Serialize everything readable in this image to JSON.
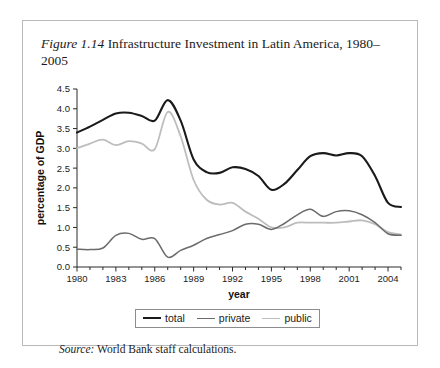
{
  "figure": {
    "label": "Figure 1.14",
    "caption": "Infrastructure Investment in Latin America, 1980–2005"
  },
  "source": {
    "label": "Source:",
    "text": "World Bank staff calculations."
  },
  "legend": {
    "position": "bottom-center",
    "items": [
      {
        "name": "total",
        "color": "#1a1a1a",
        "width": 2.1
      },
      {
        "name": "private",
        "color": "#6b6b6b",
        "width": 1.5
      },
      {
        "name": "public",
        "color": "#bdbdbd",
        "width": 1.8
      }
    ]
  },
  "chart_data": {
    "type": "line",
    "title": "Infrastructure Investment in Latin America, 1980–2005",
    "xlabel": "year",
    "ylabel": "percentage of GDP",
    "xlim": [
      1980,
      2005
    ],
    "ylim": [
      0.0,
      4.5
    ],
    "grid": false,
    "xticks": [
      1980,
      1983,
      1986,
      1989,
      1992,
      1995,
      1998,
      2001,
      2004
    ],
    "xtick_minor_step": 1,
    "yticks": [
      0.0,
      0.5,
      1.0,
      1.5,
      2.0,
      2.5,
      3.0,
      3.5,
      4.0,
      4.5
    ],
    "ytick_labels": [
      "0.0",
      "0.5",
      "1.0",
      "1.5",
      "2.0",
      "2.5",
      "3.0",
      "3.5",
      "4.0",
      "4.5"
    ],
    "x": [
      1980,
      1981,
      1982,
      1983,
      1984,
      1985,
      1986,
      1987,
      1988,
      1989,
      1990,
      1991,
      1992,
      1993,
      1994,
      1995,
      1996,
      1997,
      1998,
      1999,
      2000,
      2001,
      2002,
      2003,
      2004,
      2005
    ],
    "series": [
      {
        "name": "total",
        "color": "#1a1a1a",
        "width": 2.1,
        "values": [
          3.4,
          3.55,
          3.72,
          3.88,
          3.9,
          3.82,
          3.7,
          4.22,
          3.7,
          2.72,
          2.4,
          2.38,
          2.52,
          2.48,
          2.3,
          1.95,
          2.1,
          2.45,
          2.8,
          2.88,
          2.82,
          2.88,
          2.8,
          2.3,
          1.62,
          1.52
        ]
      },
      {
        "name": "private",
        "color": "#6b6b6b",
        "width": 1.5,
        "values": [
          0.45,
          0.44,
          0.48,
          0.8,
          0.85,
          0.7,
          0.72,
          0.25,
          0.42,
          0.55,
          0.72,
          0.82,
          0.92,
          1.08,
          1.08,
          0.95,
          1.1,
          1.32,
          1.46,
          1.28,
          1.4,
          1.42,
          1.32,
          1.12,
          0.84,
          0.8
        ]
      },
      {
        "name": "public",
        "color": "#bdbdbd",
        "width": 1.8,
        "values": [
          3.0,
          3.12,
          3.22,
          3.08,
          3.18,
          3.12,
          2.98,
          3.92,
          3.3,
          2.2,
          1.7,
          1.58,
          1.62,
          1.4,
          1.22,
          1.0,
          1.0,
          1.12,
          1.12,
          1.12,
          1.12,
          1.15,
          1.18,
          1.08,
          0.88,
          0.82
        ]
      }
    ]
  }
}
